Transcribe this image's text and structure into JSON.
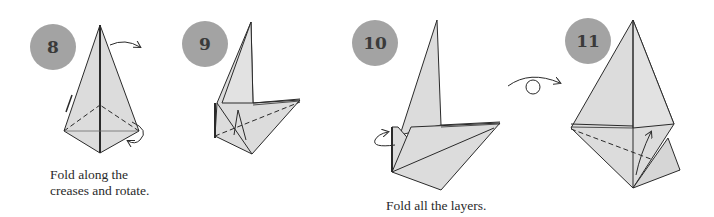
{
  "steps": [
    {
      "number": "8",
      "caption_line1": "Fold along the",
      "caption_line2": "creases and rotate."
    },
    {
      "number": "9"
    },
    {
      "number": "10",
      "caption_line1": "Fold all the layers."
    },
    {
      "number": "11"
    }
  ],
  "symbols": {
    "turn_over": "turn-over-arrow"
  },
  "colors": {
    "paper": "#dcdcdc",
    "badge": "#a3a3a3",
    "line": "#2a2a2a"
  }
}
